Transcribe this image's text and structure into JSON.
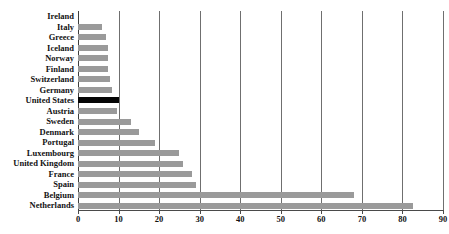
{
  "chart_data": {
    "type": "bar",
    "orientation": "horizontal",
    "title": "",
    "xlabel": "",
    "ylabel": "",
    "xlim": [
      0,
      90
    ],
    "xticks": [
      0,
      10,
      20,
      30,
      40,
      50,
      60,
      70,
      80,
      90
    ],
    "grid": "vertical",
    "legend": "none",
    "bar_color": "#9a9a9a",
    "highlight_color": "#050505",
    "highlight_category": "United States",
    "categories": [
      "Ireland",
      "Italy",
      "Greece",
      "Iceland",
      "Norway",
      "Finland",
      "Switzerland",
      "Germany",
      "United States",
      "Austria",
      "Sweden",
      "Denmark",
      "Portugal",
      "Luxembourg",
      "United Kingdom",
      "France",
      "Spain",
      "Belgium",
      "Netherlands"
    ],
    "values": [
      0,
      6,
      7,
      7.5,
      7.5,
      7.5,
      8,
      8.5,
      10,
      9.5,
      13,
      15,
      19,
      25,
      26,
      28,
      29,
      68,
      82.5
    ]
  }
}
